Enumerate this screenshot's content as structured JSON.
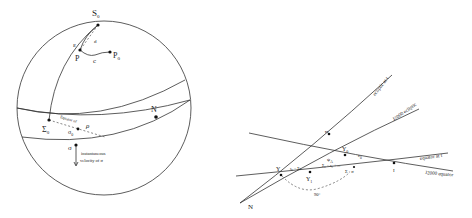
{
  "left_figure": {
    "labels": {
      "S0": "S",
      "S0_sub": "0",
      "P": "P",
      "P0": "P",
      "P0_sub": "0",
      "c": "c",
      "epsilon": "ε",
      "d": "d",
      "N": "N",
      "Sigma0": "Σ",
      "Sigma0_sub": "0",
      "sigma0": "σ",
      "sigma0_sub": "0",
      "sigma": "σ",
      "rho": "ρ",
      "eq_label": "Equator of",
      "velocity_line1": "instantaneous",
      "velocity_line2": "velocity of σ"
    }
  },
  "right_figure": {
    "labels": {
      "ecliptic_t": "ecliptic at t",
      "j2000_ecliptic": "J2000 ecliptic",
      "equator_t": "equator at t",
      "j2000_equator": "J2000 equator",
      "N": "N",
      "gamma": "Υ",
      "gamma0": "Υ",
      "gamma0_sub": "0",
      "gamma1": "Υ",
      "gamma1_sub": "1",
      "eps0": "ε",
      "eps0_sub": "0",
      "psi": "ψ",
      "psi_sub": "A",
      "chi": "χ",
      "arc1": "s₀ − Σs",
      "arc2": "Σ₀ − s₀ + ...",
      "sigma_label": "Σ · σ",
      "omega": "ϖ",
      "I": "I",
      "bottom": "90°"
    }
  }
}
